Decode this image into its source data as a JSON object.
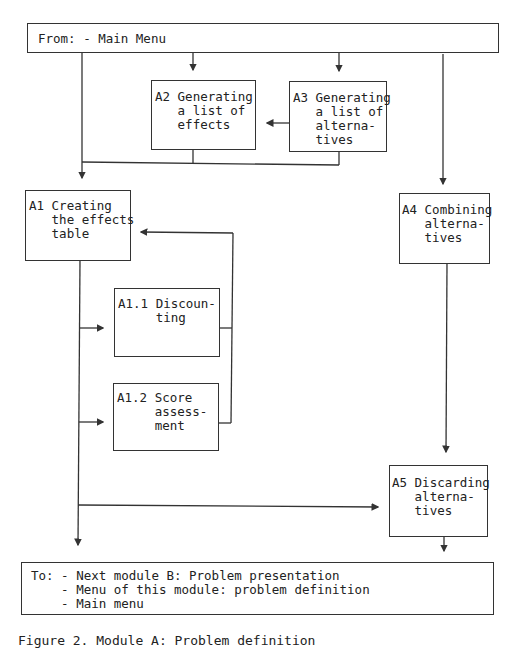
{
  "from_box": {
    "text": "From: - Main Menu"
  },
  "boxes": {
    "a1": {
      "lines": [
        "A1 Creating",
        "   the effects",
        "   table"
      ]
    },
    "a2": {
      "lines": [
        "A2 Generating",
        "   a list of",
        "   effects"
      ]
    },
    "a3": {
      "lines": [
        "A3 Generating",
        "   a list of",
        "   alterna-",
        "   tives"
      ]
    },
    "a4": {
      "lines": [
        "A4 Combining",
        "   alterna-",
        "   tives"
      ]
    },
    "a11": {
      "lines": [
        "A1.1 Discoun-",
        "     ting"
      ]
    },
    "a12": {
      "lines": [
        "A1.2 Score",
        "     assess-",
        "     ment"
      ]
    },
    "a5": {
      "lines": [
        "A5 Discarding",
        "   alterna-",
        "   tives"
      ]
    }
  },
  "to_box": {
    "lines": [
      "To: - Next module B: Problem presentation",
      "    - Menu of this module: problem definition",
      "    - Main menu"
    ]
  },
  "caption": "Figure 2. Module A: Problem definition"
}
